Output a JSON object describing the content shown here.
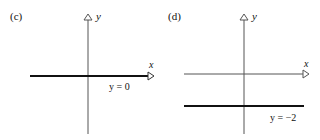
{
  "panels": [
    {
      "id": "c",
      "label": "(c)",
      "x_axis_label": "x",
      "y_axis_label": "y",
      "line_label": "y = 0",
      "line_value": 0
    },
    {
      "id": "d",
      "label": "(d)",
      "x_axis_label": "x",
      "y_axis_label": "y",
      "line_label": "y = −2",
      "line_value": -2
    }
  ],
  "colors": {
    "axis": "#333333",
    "line": "#111111"
  }
}
